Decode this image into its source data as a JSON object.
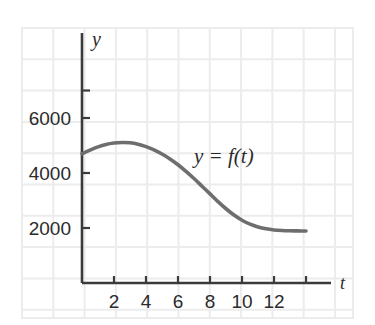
{
  "figure": {
    "background_color": "#ffffff",
    "grid_color": "#ececec",
    "axis_color": "#3b3b3b",
    "curve_color": "#6e6e6e",
    "text_color": "#2b2b2b"
  },
  "labels": {
    "y_axis_label": "y",
    "x_axis_label": "t",
    "curve_label": "y = f(t)"
  },
  "chart_data": {
    "type": "line",
    "title": "",
    "xlabel": "t",
    "ylabel": "y",
    "grid": true,
    "legend": "none",
    "annotations": [
      {
        "text": "y = f(t)",
        "x": 7.0,
        "y": 4350
      }
    ],
    "xlim": [
      0,
      15
    ],
    "ylim": [
      0,
      7400
    ],
    "xticks": [
      2,
      4,
      6,
      8,
      10,
      12,
      14
    ],
    "xtick_labels": [
      "2",
      "4",
      "6",
      "8",
      "10",
      "12",
      ""
    ],
    "yticks": [
      2000,
      4000,
      6000,
      7000
    ],
    "ytick_labels": [
      "2000",
      "4000",
      "6000",
      ""
    ],
    "series": [
      {
        "name": "f(t)",
        "x": [
          0.0,
          0.5,
          1.0,
          1.5,
          2.0,
          2.5,
          3.0,
          3.5,
          4.0,
          4.5,
          5.0,
          5.5,
          6.0,
          6.5,
          7.0,
          7.5,
          8.0,
          8.5,
          9.0,
          9.5,
          10.0,
          10.5,
          11.0,
          11.5,
          12.0,
          12.5,
          13.0,
          13.5,
          14.0
        ],
        "y": [
          4700,
          4830,
          4950,
          5040,
          5090,
          5110,
          5100,
          5050,
          4960,
          4840,
          4690,
          4510,
          4300,
          4060,
          3800,
          3520,
          3240,
          2960,
          2700,
          2470,
          2280,
          2140,
          2040,
          1970,
          1930,
          1910,
          1900,
          1895,
          1890
        ]
      }
    ]
  }
}
